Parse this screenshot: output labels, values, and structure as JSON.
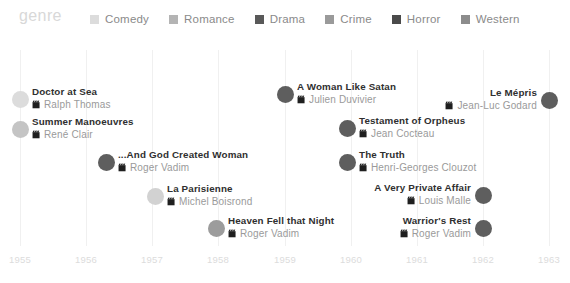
{
  "chart_data": {
    "type": "scatter",
    "title": "genre",
    "xlabel": "",
    "ylabel": "",
    "xlim": [
      1955,
      1963
    ],
    "grid": true,
    "legend_position": "top",
    "tick_labels": [
      "1955",
      "1956",
      "1957",
      "1958",
      "1959",
      "1960",
      "1961",
      "1962",
      "1963"
    ],
    "legend": [
      {
        "label": "Comedy",
        "color": "#dcdcdc",
        "swatch_icon": "square-swatch"
      },
      {
        "label": "Romance",
        "color": "#b4b4b4",
        "swatch_icon": "square-swatch"
      },
      {
        "label": "Drama",
        "color": "#595959",
        "swatch_icon": "square-swatch"
      },
      {
        "label": "Crime",
        "color": "#9a9a9a",
        "swatch_icon": "square-swatch"
      },
      {
        "label": "Horror",
        "color": "#4a4a4a",
        "swatch_icon": "square-swatch"
      },
      {
        "label": "Western",
        "color": "#8c8c8c",
        "swatch_icon": "square-swatch"
      }
    ],
    "points": [
      {
        "title": "Doctor at Sea",
        "director": "Ralph Thomas",
        "year": 1955,
        "x": 20,
        "y": 61,
        "color": "#dcdcdc",
        "side": "right",
        "director_icon": "clapperboard-icon"
      },
      {
        "title": "Summer Manoeuvres",
        "director": "René Clair",
        "year": 1955,
        "x": 20,
        "y": 91,
        "color": "#c4c4c4",
        "side": "right",
        "director_icon": "clapperboard-icon"
      },
      {
        "title": "...And God Created Woman",
        "director": "Roger Vadim",
        "year": 1956,
        "x": 106,
        "y": 124,
        "color": "#5e5e5e",
        "side": "right",
        "director_icon": "clapperboard-icon"
      },
      {
        "title": "La Parisienne",
        "director": "Michel Boisrond",
        "year": 1957,
        "x": 155,
        "y": 158,
        "color": "#d2d2d2",
        "side": "right",
        "director_icon": "clapperboard-icon"
      },
      {
        "title": "Heaven Fell that Night",
        "director": "Roger Vadim",
        "year": 1958,
        "x": 216,
        "y": 190,
        "color": "#9c9c9c",
        "side": "right",
        "director_icon": "clapperboard-icon"
      },
      {
        "title": "A Woman Like Satan",
        "director": "Julien Duvivier",
        "year": 1959,
        "x": 285,
        "y": 56,
        "color": "#5e5e5e",
        "side": "right",
        "director_icon": "clapperboard-icon"
      },
      {
        "title": "Testament of Orpheus",
        "director": "Jean Cocteau",
        "year": 1960,
        "x": 347,
        "y": 90,
        "color": "#5e5e5e",
        "side": "right",
        "director_icon": "clapperboard-icon"
      },
      {
        "title": "The Truth",
        "director": "Henri-Georges Clouzot",
        "year": 1960,
        "x": 347,
        "y": 124,
        "color": "#5e5e5e",
        "side": "right",
        "director_icon": "clapperboard-icon"
      },
      {
        "title": "A Very Private Affair",
        "director": "Louis Malle",
        "year": 1961,
        "x": 483,
        "y": 157,
        "color": "#5e5e5e",
        "side": "left",
        "director_icon": "clapperboard-icon"
      },
      {
        "title": "Warrior's Rest",
        "director": "Roger Vadim",
        "year": 1962,
        "x": 483,
        "y": 190,
        "color": "#5e5e5e",
        "side": "left",
        "director_icon": "clapperboard-icon"
      },
      {
        "title": "Le Mépris",
        "director": "Jean-Luc Godard",
        "year": 1963,
        "x": 549,
        "y": 62,
        "color": "#5e5e5e",
        "side": "left",
        "director_icon": "clapperboard-icon"
      }
    ],
    "gridlines_x": [
      20,
      86,
      152,
      218,
      285,
      351,
      417,
      483,
      549
    ]
  }
}
